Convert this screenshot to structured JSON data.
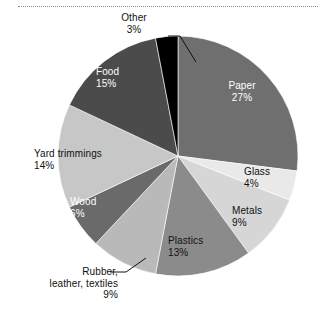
{
  "figure": {
    "has_top_dotted_rule": true,
    "background_color": "#ffffff"
  },
  "chart_data": {
    "type": "pie",
    "title": "",
    "xlabel": "",
    "ylabel": "",
    "legend_position": "none",
    "labels_inline": true,
    "categories": [
      "Paper",
      "Glass",
      "Metals",
      "Plastics",
      "Rubber, leather, textiles",
      "Wood",
      "Yard trimmings",
      "Food",
      "Other"
    ],
    "values": [
      27,
      4,
      9,
      13,
      9,
      6,
      14,
      15,
      3
    ],
    "value_unit": "%",
    "start_angle_deg": 0,
    "direction": "clockwise",
    "slices": [
      {
        "label": "Paper",
        "value": 27,
        "value_text": "27%",
        "color": "#6f6f6f",
        "label_color": "#ffffff",
        "label_placement": "inside",
        "leader_line": false
      },
      {
        "label": "Glass",
        "value": 4,
        "value_text": "4%",
        "color": "#e9e9e9",
        "label_color": "#111111",
        "label_placement": "outside",
        "leader_line": false
      },
      {
        "label": "Metals",
        "value": 9,
        "value_text": "9%",
        "color": "#d6d6d6",
        "label_color": "#111111",
        "label_placement": "outside",
        "leader_line": false
      },
      {
        "label": "Plastics",
        "value": 13,
        "value_text": "13%",
        "color": "#8b8b8b",
        "label_color": "#111111",
        "label_placement": "inside",
        "leader_line": false
      },
      {
        "label": "Rubber, leather, textiles",
        "value": 9,
        "value_text": "9%",
        "color": "#b9b9b9",
        "label_color": "#111111",
        "label_placement": "outside",
        "leader_line": true
      },
      {
        "label": "Wood",
        "value": 6,
        "value_text": "6%",
        "color": "#6a6a6a",
        "label_color": "#ffffff",
        "label_placement": "inside",
        "leader_line": false
      },
      {
        "label": "Yard trimmings",
        "value": 14,
        "value_text": "14%",
        "color": "#c7c7c7",
        "label_color": "#111111",
        "label_placement": "inside",
        "leader_line": false
      },
      {
        "label": "Food",
        "value": 15,
        "value_text": "15%",
        "color": "#4b4b4b",
        "label_color": "#ffffff",
        "label_placement": "inside",
        "leader_line": false
      },
      {
        "label": "Other",
        "value": 3,
        "value_text": "3%",
        "color": "#000000",
        "label_color": "#111111",
        "label_placement": "outside",
        "leader_line": true
      }
    ]
  },
  "labels": {
    "paper": {
      "name": "Paper",
      "pct": "27%"
    },
    "glass": {
      "name": "Glass",
      "pct": "4%"
    },
    "metals": {
      "name": "Metals",
      "pct": "9%"
    },
    "plastics": {
      "name": "Plastics",
      "pct": "13%"
    },
    "rubber": {
      "name": "Rubber,",
      "name2": "leather, textiles",
      "pct": "9%"
    },
    "wood": {
      "name": "Wood",
      "pct": "6%"
    },
    "yard": {
      "name": "Yard trimmings",
      "pct": "14%"
    },
    "food": {
      "name": "Food",
      "pct": "15%"
    },
    "other": {
      "name": "Other",
      "pct": "3%"
    }
  }
}
